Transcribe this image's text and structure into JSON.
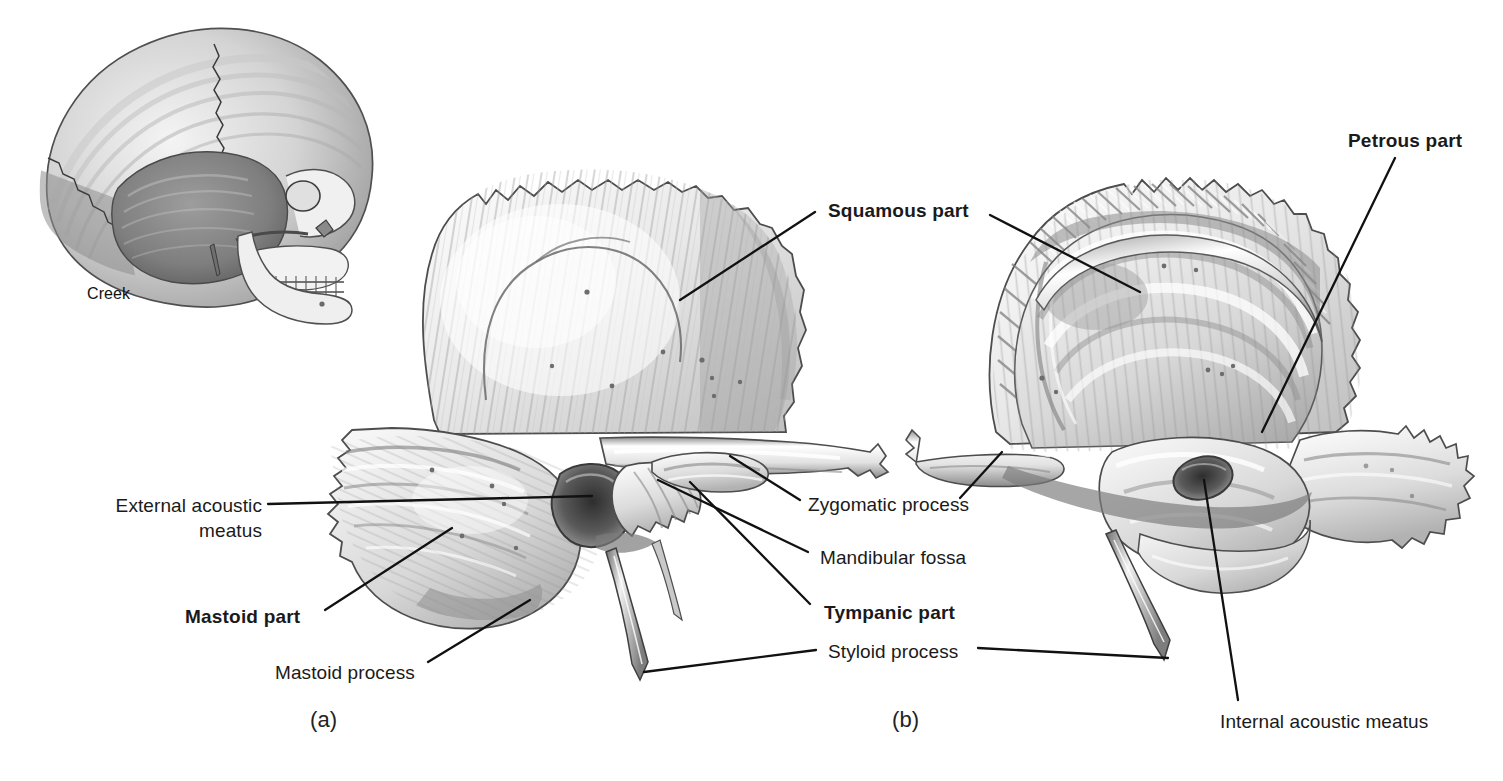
{
  "figure": {
    "artist_credit": "Creek",
    "background_color": "#ffffff",
    "ink_color": "#1a1a1a"
  },
  "panels": [
    {
      "id": "a",
      "caption": "(a)",
      "view": "lateral (external) view of right temporal bone"
    },
    {
      "id": "b",
      "caption": "(b)",
      "view": "medial (internal) view of right temporal bone"
    }
  ],
  "labels": [
    {
      "id": "squamous-part",
      "text": "Squamous part",
      "bold": true,
      "align": "center"
    },
    {
      "id": "petrous-part",
      "text": "Petrous part",
      "bold": true,
      "align": "center"
    },
    {
      "id": "external-acoustic-meatus",
      "line1": "External acoustic",
      "line2": "meatus",
      "bold": false,
      "align": "right"
    },
    {
      "id": "mastoid-part",
      "text": "Mastoid part",
      "bold": true,
      "align": "left"
    },
    {
      "id": "mastoid-process",
      "text": "Mastoid process",
      "bold": false,
      "align": "left"
    },
    {
      "id": "zygomatic-process",
      "text": "Zygomatic process",
      "bold": false,
      "align": "left"
    },
    {
      "id": "mandibular-fossa",
      "text": "Mandibular fossa",
      "bold": false,
      "align": "left"
    },
    {
      "id": "tympanic-part",
      "text": "Tympanic part",
      "bold": true,
      "align": "left"
    },
    {
      "id": "styloid-process",
      "text": "Styloid process",
      "bold": false,
      "align": "left"
    },
    {
      "id": "internal-acoustic-meatus",
      "text": "Internal acoustic meatus",
      "bold": false,
      "align": "left"
    }
  ],
  "inset": {
    "description": "lateral view of whole skull with temporal bone shaded",
    "credit": "Creek"
  }
}
